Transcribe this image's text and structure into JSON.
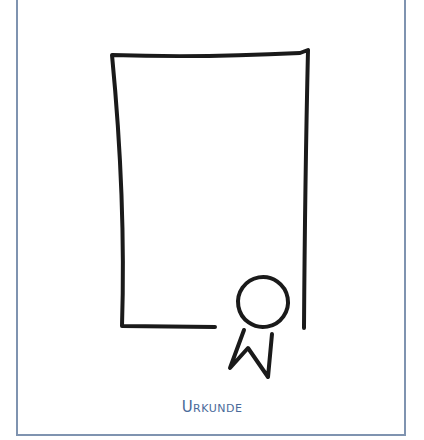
{
  "illustration": {
    "subject": "certificate-with-rosette",
    "caption": "Urkunde",
    "colors": {
      "frame_border": "#7f93b0",
      "caption": "#4a6a9a",
      "stroke": "#1a1a1a"
    }
  }
}
